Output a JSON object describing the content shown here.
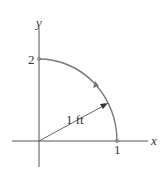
{
  "figure": {
    "type": "quarter-ellipse path diagram",
    "axes": {
      "x_label": "x",
      "y_label": "y"
    },
    "ticks": {
      "x_tick_label": "1",
      "y_tick_label": "2"
    },
    "radius_label": "1 ft",
    "path_direction": "counterclockwise",
    "colors": {
      "axes": "#555555",
      "curve": "#777777",
      "text": "#333333",
      "background": "#ffffff"
    }
  }
}
